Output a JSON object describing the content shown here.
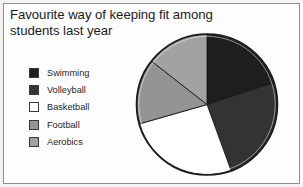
{
  "chart_data": {
    "type": "pie",
    "title": "Favourite way of keeping fit among students last year",
    "title_line1": "Favourite way of keeping fit among",
    "title_line2": "students last year",
    "xlabel": "",
    "ylabel": "",
    "legend_position": "left",
    "grid": false,
    "start_angle_deg": 0,
    "direction": "clockwise",
    "categories": [
      "Swimming",
      "Volleyball",
      "Basketball",
      "Football",
      "Aerobics"
    ],
    "values": [
      20,
      24.5,
      26,
      15,
      14.5
    ],
    "units": "percent",
    "angles_deg": [
      72,
      88,
      94,
      54,
      52
    ],
    "colors": [
      "#1e1e1e",
      "#333333",
      "#ffffff",
      "#949494",
      "#a2a2a2"
    ],
    "slices": [
      {
        "label": "Swimming",
        "value": 20,
        "angle_deg": 72,
        "color": "#1e1e1e",
        "start_deg": 0,
        "end_deg": 72
      },
      {
        "label": "Volleyball",
        "value": 24.5,
        "angle_deg": 88,
        "color": "#333333",
        "start_deg": 72,
        "end_deg": 160
      },
      {
        "label": "Basketball",
        "value": 26,
        "angle_deg": 94,
        "color": "#ffffff",
        "start_deg": 160,
        "end_deg": 254
      },
      {
        "label": "Football",
        "value": 15,
        "angle_deg": 54,
        "color": "#949494",
        "start_deg": 254,
        "end_deg": 308
      },
      {
        "label": "Aerobics",
        "value": 14.5,
        "angle_deg": 52,
        "color": "#a2a2a2",
        "start_deg": 308,
        "end_deg": 360
      }
    ]
  },
  "title": {
    "line1": "Favourite way of keeping fit among",
    "line2": "students last year"
  },
  "legend": {
    "items": [
      {
        "label": "Swimming",
        "color": "#1e1e1e"
      },
      {
        "label": "Volleyball",
        "color": "#333333"
      },
      {
        "label": "Basketball",
        "color": "#ffffff"
      },
      {
        "label": "Football",
        "color": "#949494"
      },
      {
        "label": "Aerobics",
        "color": "#a2a2a2"
      }
    ]
  },
  "style": {
    "outline": "#1a1a1a",
    "page_border": "#8d8d8d",
    "background": "#fdfdfd",
    "text": "#1b1b1b"
  }
}
